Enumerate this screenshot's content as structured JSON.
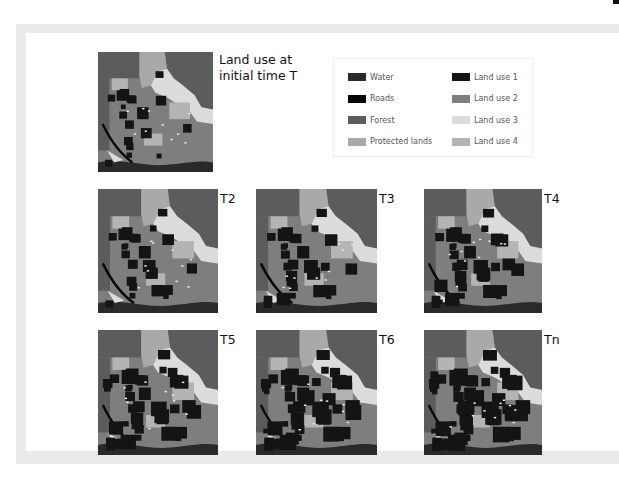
{
  "figure": {
    "initial_label_line1": "Land use at",
    "initial_label_line2": "initial time T",
    "maps": [
      {
        "id": "T",
        "label": "",
        "x": 98,
        "y": 52,
        "w": 115,
        "h": 120,
        "dark": 0.1
      },
      {
        "id": "T2",
        "label": "T2",
        "x": 98,
        "y": 189,
        "w": 120,
        "h": 124,
        "dark": 0.18
      },
      {
        "id": "T3",
        "label": "T3",
        "x": 256,
        "y": 189,
        "w": 121,
        "h": 124,
        "dark": 0.26
      },
      {
        "id": "T4",
        "label": "T4",
        "x": 424,
        "y": 189,
        "w": 118,
        "h": 124,
        "dark": 0.34
      },
      {
        "id": "T5",
        "label": "T5",
        "x": 98,
        "y": 330,
        "w": 120,
        "h": 125,
        "dark": 0.42
      },
      {
        "id": "T6",
        "label": "T6",
        "x": 256,
        "y": 330,
        "w": 121,
        "h": 125,
        "dark": 0.5
      },
      {
        "id": "Tn",
        "label": "Tn",
        "x": 424,
        "y": 330,
        "w": 118,
        "h": 125,
        "dark": 0.58
      }
    ]
  },
  "legend": {
    "items": [
      {
        "label": "Water",
        "color": "#2a2a2a",
        "col": 0,
        "row": 0
      },
      {
        "label": "Roads",
        "color": "#050505",
        "col": 0,
        "row": 1
      },
      {
        "label": "Forest",
        "color": "#5c5c5c",
        "col": 0,
        "row": 2
      },
      {
        "label": "Protected lands",
        "color": "#a9a9a9",
        "col": 0,
        "row": 3
      },
      {
        "label": "Land use 1",
        "color": "#141414",
        "col": 1,
        "row": 0
      },
      {
        "label": "Land use 2",
        "color": "#7e7e7e",
        "col": 1,
        "row": 1
      },
      {
        "label": "Land use 3",
        "color": "#dcdcdc",
        "col": 1,
        "row": 2
      },
      {
        "label": "Land use 4",
        "color": "#b4b4b4",
        "col": 1,
        "row": 3
      }
    ]
  },
  "colors": {
    "frame": "#ebebeb",
    "forest": "#5c5c5c",
    "protected": "#a9a9a9",
    "landuse1": "#141414",
    "landuse2": "#7e7e7e",
    "landuse3": "#dcdcdc",
    "landuse4": "#b4b4b4",
    "water": "#2a2a2a",
    "roads": "#050505"
  }
}
